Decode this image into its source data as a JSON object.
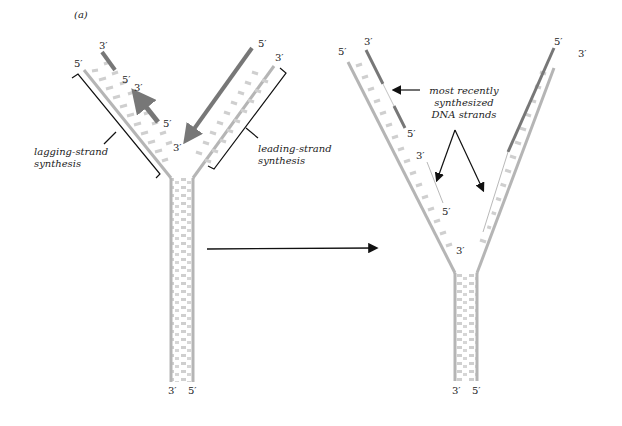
{
  "panel_label": "(a)",
  "colors": {
    "backbone": "#b5b5b5",
    "base": "#cfcfcf",
    "new_strand": "#777777",
    "ink": "#111111"
  },
  "left_fork": {
    "top_left": {
      "five": "5′",
      "three_new": "3′",
      "five_new": "5′"
    },
    "okazaki": {
      "three": "3′",
      "five": "5′"
    },
    "leading": {
      "five": "5′",
      "three": "3′",
      "three_tip": "3′"
    },
    "bottom": {
      "left": "3′",
      "right": "5′"
    },
    "lagging_label": [
      "lagging-strand",
      "synthesis"
    ],
    "leading_label": [
      "leading-strand",
      "synthesis"
    ]
  },
  "right_fork": {
    "top_left": {
      "five": "5′",
      "three": "3′",
      "five_mid": "5′"
    },
    "okazaki": {
      "three": "3′",
      "five": "5′"
    },
    "leading": {
      "five": "5′",
      "three": "3′",
      "three_tip": "3′"
    },
    "bottom": {
      "left": "3′",
      "right": "5′"
    },
    "annotation": [
      "most recently",
      "synthesized",
      "DNA strands"
    ]
  }
}
